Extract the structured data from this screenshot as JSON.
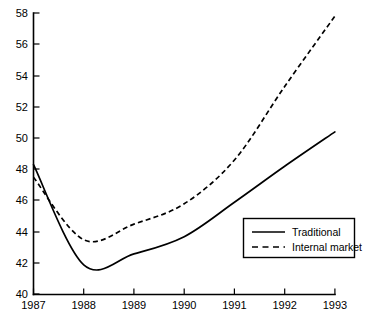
{
  "chart_data": {
    "type": "line",
    "title": "",
    "subtitle": "",
    "xlabel": "",
    "ylabel": "",
    "x": [
      1987,
      1988,
      1989,
      1990,
      1991,
      1992,
      1993
    ],
    "xtick_labels": [
      "1987",
      "1988",
      "1989",
      "1990",
      "1991",
      "1992",
      "1993"
    ],
    "ytick_labels": [
      "40",
      "42",
      "44",
      "46",
      "48",
      "50",
      "52",
      "54",
      "56",
      "58"
    ],
    "ytick_values": [
      40,
      42,
      44,
      46,
      48,
      50,
      52,
      54,
      56,
      58
    ],
    "xlim": [
      1987,
      1993
    ],
    "ylim": [
      40,
      58
    ],
    "grid": false,
    "legend_position": "bottom-right",
    "series": [
      {
        "name": "Traditional",
        "style": "solid",
        "color": "#000000",
        "values": [
          48.3,
          41.9,
          42.6,
          43.7,
          45.9,
          48.2,
          50.4
        ]
      },
      {
        "name": "Internal market",
        "style": "dashed",
        "color": "#000000",
        "values": [
          47.5,
          43.5,
          44.5,
          45.8,
          48.6,
          53.3,
          57.8
        ]
      }
    ],
    "annotations": []
  },
  "legend": {
    "entries": [
      {
        "label": "Traditional",
        "style": "solid"
      },
      {
        "label": "Internal market",
        "style": "dashed"
      }
    ]
  },
  "axes": {
    "x_tick_labels": [
      "1987",
      "1988",
      "1989",
      "1990",
      "1991",
      "1992",
      "1993"
    ],
    "y_tick_labels": [
      "58",
      "56",
      "54",
      "52",
      "50",
      "48",
      "46",
      "44",
      "42",
      "40"
    ]
  },
  "colors": {
    "ink": "#000000",
    "background": "#ffffff"
  }
}
